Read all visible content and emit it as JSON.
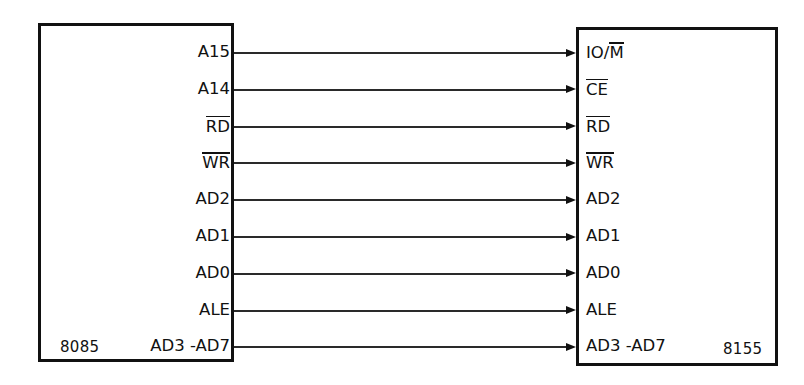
{
  "diagram": {
    "left_chip": {
      "name": "8085"
    },
    "right_chip": {
      "name": "8155"
    },
    "colors": {
      "background": "#ffffff",
      "border": "#111111",
      "wire": "#2a2a2a",
      "text": "#111111"
    },
    "connections": [
      {
        "left": "A15",
        "left_overbar": "none",
        "right": "IO/M",
        "right_overbar": "M",
        "arrow": "right"
      },
      {
        "left": "A14",
        "left_overbar": "none",
        "right": "CE",
        "right_overbar": "all",
        "arrow": "right"
      },
      {
        "left": "RD",
        "left_overbar": "all",
        "right": "RD",
        "right_overbar": "all",
        "arrow": "right"
      },
      {
        "left": "WR",
        "left_overbar": "all",
        "right": "WR",
        "right_overbar": "all",
        "arrow": "right"
      },
      {
        "left": "AD2",
        "left_overbar": "none",
        "right": "AD2",
        "right_overbar": "none",
        "arrow": "right"
      },
      {
        "left": "AD1",
        "left_overbar": "none",
        "right": "AD1",
        "right_overbar": "none",
        "arrow": "right"
      },
      {
        "left": "AD0",
        "left_overbar": "none",
        "right": "AD0",
        "right_overbar": "none",
        "arrow": "right"
      },
      {
        "left": "ALE",
        "left_overbar": "none",
        "right": "ALE",
        "right_overbar": "none",
        "arrow": "right"
      },
      {
        "left": "AD3 -AD7",
        "left_overbar": "none",
        "right": "AD3 -AD7",
        "right_overbar": "none",
        "arrow": "right"
      }
    ]
  }
}
